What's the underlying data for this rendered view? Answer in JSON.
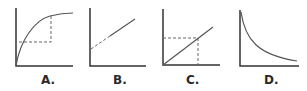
{
  "figure": {
    "panels": [
      {
        "id": "A",
        "label": "A.",
        "shape": "concave increasing curve with dashed lines to a point",
        "x": 43
      },
      {
        "id": "B",
        "label": "B.",
        "shape": "straight line with positive slope and nonzero intercept, dashed near axis",
        "x": 113
      },
      {
        "id": "C",
        "label": "C.",
        "shape": "straight line through origin with dashed lines to a point",
        "x": 186
      },
      {
        "id": "D",
        "label": "D.",
        "shape": "decreasing convex curve (inverse relationship)",
        "x": 264
      }
    ],
    "colors": {
      "axis": "#333333",
      "curve": "#555555",
      "dash": "#666666"
    }
  }
}
